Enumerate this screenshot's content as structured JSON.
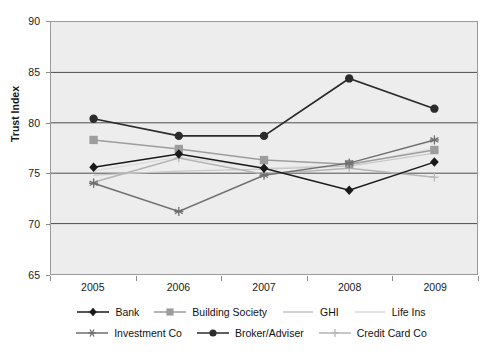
{
  "chart_data": {
    "type": "line",
    "title": "",
    "xlabel": "",
    "ylabel": "Trust Index",
    "categories": [
      "2005",
      "2006",
      "2007",
      "2008",
      "2009"
    ],
    "x": [
      2005,
      2006,
      2007,
      2008,
      2009
    ],
    "ylim": [
      65,
      90
    ],
    "yticks": [
      65,
      70,
      75,
      80,
      85,
      90
    ],
    "grid": "horizontal",
    "legend_position": "bottom",
    "series": [
      {
        "name": "Bank",
        "marker": "diamond",
        "color": "#1a1a1a",
        "values": [
          75.6,
          76.9,
          75.5,
          73.3,
          76.1
        ]
      },
      {
        "name": "Building Society",
        "marker": "square",
        "color": "#9d9d9d",
        "values": [
          78.3,
          77.4,
          76.3,
          75.9,
          77.3
        ]
      },
      {
        "name": "GHI",
        "marker": "none",
        "color": "#c8c8c8",
        "values": [
          74.8,
          75.2,
          75.4,
          75.7,
          77.0
        ]
      },
      {
        "name": "Life Ins",
        "marker": "none",
        "color": "#dcdcdc",
        "values": [
          75.2,
          76.6,
          75.5,
          75.8,
          77.5
        ]
      },
      {
        "name": "Investment Co",
        "marker": "asterisk",
        "color": "#6f6f6f",
        "values": [
          74.0,
          71.2,
          74.8,
          76.0,
          78.3
        ]
      },
      {
        "name": "Broker/Adviser",
        "marker": "circle",
        "color": "#2b2b2b",
        "values": [
          80.4,
          78.7,
          78.7,
          84.4,
          81.4
        ]
      },
      {
        "name": "Credit Card Co",
        "marker": "plus",
        "color": "#b4b4b4",
        "values": [
          74.1,
          76.5,
          74.9,
          75.5,
          74.6
        ]
      }
    ]
  },
  "axes": {
    "y_title": "Trust Index",
    "y_tick_labels": [
      "90",
      "85",
      "80",
      "75",
      "70",
      "65"
    ],
    "x_tick_labels": [
      "2005",
      "2006",
      "2007",
      "2008",
      "2009"
    ]
  },
  "legend": {
    "row1": [
      "Bank",
      "Building Society",
      "GHI",
      "Life Ins"
    ],
    "row2": [
      "Investment Co",
      "Broker/Adviser",
      "Credit Card Co"
    ]
  },
  "colors": {
    "plot_background": "#ededed",
    "plot_border": "#9a9a9a",
    "gridline": "#4d4d4d",
    "text": "#1a1a1a"
  }
}
